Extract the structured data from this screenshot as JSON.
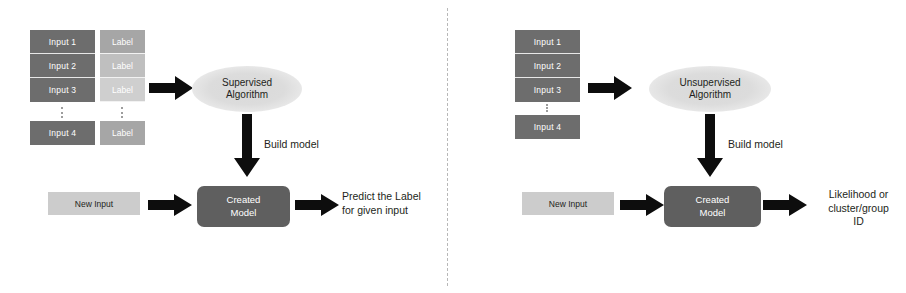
{
  "diagram": {
    "title_hidden": "Supervised vs Unsupervised Learning Workflow",
    "divider": {
      "style": "dashed-vertical"
    },
    "colors": {
      "input_box": "#6d6d6d",
      "label_box": "#a6a6a6",
      "model_box": "#5f5f5f",
      "new_input_box": "#cccccc",
      "ellipse": "#d9d9d9",
      "arrow": "#000000",
      "divider": "#b8b8b8",
      "text": "#231f20",
      "box_text": "#ffffff"
    }
  },
  "left_panel": {
    "name": "supervised-learning",
    "inputs": [
      {
        "label": "Input 1"
      },
      {
        "label": "Input 2"
      },
      {
        "label": "Input 3"
      },
      {
        "label": "Input 4"
      }
    ],
    "labels": [
      {
        "label": "Label"
      },
      {
        "label": "Label"
      },
      {
        "label": "Label"
      },
      {
        "label": "Label"
      }
    ],
    "ellipsis": "⋮",
    "algorithm": {
      "line1": "Supervised",
      "line2": "Algorithm"
    },
    "build_arrow_label": "Build model",
    "model": {
      "line1": "Created",
      "line2": "Model"
    },
    "new_input": "New Input",
    "output": {
      "line1": "Predict the Label",
      "line2": "for given input"
    }
  },
  "right_panel": {
    "name": "unsupervised-learning",
    "inputs": [
      {
        "label": "Input 1"
      },
      {
        "label": "Input 2"
      },
      {
        "label": "Input 3"
      },
      {
        "label": "Input 4"
      }
    ],
    "ellipsis": "⋮",
    "algorithm": {
      "line1": "Unsupervised",
      "line2": "Algorithm"
    },
    "build_arrow_label": "Build model",
    "model": {
      "line1": "Created",
      "line2": "Model"
    },
    "new_input": "New Input",
    "output": {
      "line1": "Likelihood or",
      "line2": "cluster/group",
      "line3": "ID"
    }
  }
}
